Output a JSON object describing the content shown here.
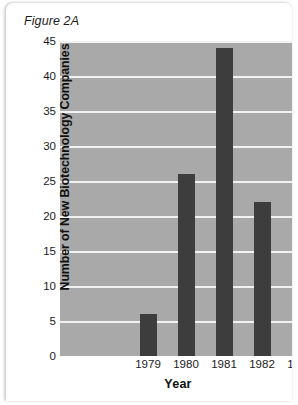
{
  "figure": {
    "title": "Figure 2A"
  },
  "chart_data": {
    "type": "bar",
    "title": "Figure 2A",
    "xlabel": "Year",
    "ylabel": "Number of New Biotechnology Companies",
    "categories": [
      "1979",
      "1980",
      "1981",
      "1982",
      "1983"
    ],
    "values": [
      6,
      26,
      44,
      22,
      3
    ],
    "ylim": [
      0,
      45
    ],
    "yticks": [
      0,
      5,
      10,
      15,
      20,
      25,
      30,
      35,
      40,
      45
    ],
    "grid": true,
    "legend": false,
    "colors": {
      "bar": "#3d3d3d",
      "plot_background": "#a9a9a9",
      "gridline": "#f2f2f2",
      "text": "#1b1b1b",
      "card_background": "#ffffff"
    }
  }
}
